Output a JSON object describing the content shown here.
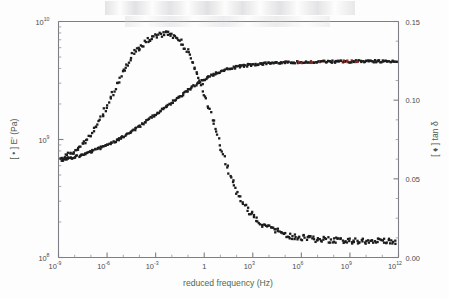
{
  "figure": {
    "title": "",
    "background_color": "#fdfdfd",
    "axis_color": "#7e7e84",
    "marker_color": "#1c1c1c",
    "accent_color": "#8a2a22"
  },
  "axes": {
    "x": {
      "label": "reduced frequency (Hz)",
      "scale": "log",
      "min_exp": -9,
      "max_exp": 12,
      "tick_labels": [
        "10-9",
        "10-6",
        "10-3",
        "1",
        "103",
        "106",
        "109",
        "1012"
      ],
      "tick_mantissas": [
        "10",
        "10",
        "10",
        "1",
        "10",
        "10",
        "10",
        "10"
      ],
      "tick_exponents": [
        "-9",
        "-6",
        "-3",
        "",
        "3",
        "6",
        "9",
        "12"
      ],
      "tick_exps_numeric": [
        -9,
        -6,
        -3,
        0,
        3,
        6,
        9,
        12
      ]
    },
    "y_left": {
      "label": "[ • ] E' (Pa)",
      "label_marker": "•",
      "label_text": "E' (Pa)",
      "scale": "log",
      "min_exp": 8,
      "max_exp": 10,
      "tick_mantissas": [
        "10",
        "10",
        "10"
      ],
      "tick_exponents": [
        "8",
        "9",
        "10"
      ],
      "tick_exps_numeric": [
        8,
        9,
        10
      ]
    },
    "y_right": {
      "label": "[ ♦ ] tan δ",
      "label_marker": "♦",
      "label_text": "tan δ",
      "scale": "linear",
      "min": 0.0,
      "max": 0.15,
      "tick_labels": [
        "0.00",
        "0.05",
        "0.10",
        "0.15"
      ],
      "tick_values": [
        0.0,
        0.05,
        0.1,
        0.15
      ],
      "minor_step": 0.0125
    }
  },
  "chart_data": {
    "type": "scatter",
    "title": "",
    "xlabel": "reduced frequency (Hz)",
    "ylabel": "[ • ] E' (Pa)",
    "ylabel_right": "[ ♦ ] tan δ",
    "xlim_log10": [
      -9,
      12
    ],
    "ylim_left_log10": [
      8,
      10
    ],
    "ylim_right": [
      0,
      0.15
    ],
    "grid": false,
    "legend": "none (markers identified in axis labels)",
    "series": [
      {
        "name": "E' (Pa)",
        "marker": "•",
        "axis": "left",
        "color": "#1c1c1c",
        "x_log10": [
          -8.82,
          -8.72,
          -8.62,
          -8.5,
          -8.38,
          -8.28,
          -8.16,
          -8.06,
          -7.95,
          -7.85,
          -7.72,
          -7.6,
          -7.5,
          -7.38,
          -7.26,
          -7.14,
          -7.02,
          -6.9,
          -6.78,
          -6.64,
          -6.5,
          -6.38,
          -6.24,
          -6.1,
          -5.96,
          -5.82,
          -5.68,
          -5.54,
          -5.4,
          -5.26,
          -5.1,
          -4.96,
          -4.8,
          -4.66,
          -4.5,
          -4.34,
          -4.18,
          -4.02,
          -3.86,
          -3.7,
          -3.54,
          -3.36,
          -3.2,
          -3.02,
          -2.86,
          -2.68,
          -2.5,
          -2.32,
          -2.14,
          -1.96,
          -1.78,
          -1.6,
          -1.42,
          -1.22,
          -1.04,
          -0.84,
          -0.66,
          -0.46,
          -0.26,
          -0.06,
          0.14,
          0.34,
          0.56,
          0.76,
          0.98,
          1.18,
          1.4,
          1.62,
          1.84,
          2.06,
          2.3,
          2.52,
          2.76,
          3.0,
          3.24,
          3.5,
          3.74,
          4.0,
          4.26,
          4.52,
          4.8,
          5.06,
          5.34,
          5.62,
          5.9,
          6.2,
          6.48,
          6.78,
          7.08,
          7.38,
          7.7,
          8.0,
          8.32,
          8.64,
          8.96,
          9.3,
          9.62,
          9.96,
          10.3,
          10.64,
          10.98,
          11.3,
          11.62,
          11.85
        ],
        "y_pa": [
          670000000.0,
          675000000.0,
          680000000.0,
          685000000.0,
          690000000.0,
          695000000.0,
          700000000.0,
          705000000.0,
          710000000.0,
          720000000.0,
          730000000.0,
          740000000.0,
          750000000.0,
          760000000.0,
          770000000.0,
          780000000.0,
          790000000.0,
          800000000.0,
          810000000.0,
          825000000.0,
          840000000.0,
          855000000.0,
          870000000.0,
          885000000.0,
          900000000.0,
          920000000.0,
          940000000.0,
          960000000.0,
          980000000.0,
          1000000000.0,
          1030000000.0,
          1060000000.0,
          1090000000.0,
          1120000000.0,
          1160000000.0,
          1200000000.0,
          1240000000.0,
          1280000000.0,
          1330000000.0,
          1380000000.0,
          1430000000.0,
          1490000000.0,
          1550000000.0,
          1610000000.0,
          1680000000.0,
          1750000000.0,
          1820000000.0,
          1900000000.0,
          1980000000.0,
          2070000000.0,
          2160000000.0,
          2260000000.0,
          2360000000.0,
          2470000000.0,
          2580000000.0,
          2700000000.0,
          2820000000.0,
          2950000000.0,
          3080000000.0,
          3200000000.0,
          3320000000.0,
          3440000000.0,
          3550000000.0,
          3660000000.0,
          3760000000.0,
          3850000000.0,
          3930000000.0,
          4000000000.0,
          4070000000.0,
          4130000000.0,
          4180000000.0,
          4230000000.0,
          4270000000.0,
          4310000000.0,
          4340000000.0,
          4370000000.0,
          4400000000.0,
          4420000000.0,
          4440000000.0,
          4460000000.0,
          4480000000.0,
          4490000000.0,
          4500000000.0,
          4510000000.0,
          4520000000.0,
          4530000000.0,
          4540000000.0,
          4550000000.0,
          4550000000.0,
          4560000000.0,
          4570000000.0,
          4570000000.0,
          4580000000.0,
          4580000000.0,
          4590000000.0,
          4590000000.0,
          4600000000.0,
          4600000000.0,
          4600000000.0,
          4610000000.0,
          4610000000.0,
          4610000000.0,
          4620000000.0,
          4620000000.0,
          4620000000.0
        ]
      },
      {
        "name": "tan delta",
        "marker": "♦",
        "axis": "right",
        "color": "#1c1c1c",
        "x_log10": [
          -8.86,
          -8.74,
          -8.62,
          -8.5,
          -8.4,
          -8.28,
          -8.18,
          -8.06,
          -7.96,
          -7.84,
          -7.74,
          -7.62,
          -7.5,
          -7.38,
          -7.26,
          -7.12,
          -7.0,
          -6.86,
          -6.72,
          -6.58,
          -6.44,
          -6.3,
          -6.16,
          -6.0,
          -5.86,
          -5.7,
          -5.54,
          -5.38,
          -5.22,
          -5.06,
          -4.9,
          -4.72,
          -4.56,
          -4.38,
          -4.22,
          -4.04,
          -3.86,
          -3.7,
          -3.52,
          -3.34,
          -3.16,
          -2.98,
          -2.8,
          -2.62,
          -2.44,
          -2.26,
          -2.08,
          -1.9,
          -1.72,
          -1.54,
          -1.36,
          -1.18,
          -1.0,
          -0.82,
          -0.64,
          -0.46,
          -0.28,
          -0.1,
          0.08,
          0.26,
          0.44,
          0.62,
          0.8,
          0.98,
          1.16,
          1.34,
          1.52,
          1.7,
          1.9,
          2.1,
          2.3,
          2.5,
          2.72,
          2.94,
          3.16,
          3.4,
          3.64,
          3.9,
          4.14,
          4.4,
          4.66,
          4.94,
          5.2,
          5.48,
          5.76,
          6.06,
          6.34,
          6.64,
          6.94,
          7.26,
          7.56,
          7.88,
          8.2,
          8.52,
          8.86,
          9.18,
          9.52,
          9.86,
          10.2,
          10.54,
          10.88,
          11.2,
          11.54,
          11.85
        ],
        "y_tan": [
          0.062,
          0.063,
          0.064,
          0.064,
          0.065,
          0.066,
          0.067,
          0.067,
          0.068,
          0.069,
          0.07,
          0.071,
          0.072,
          0.073,
          0.074,
          0.076,
          0.078,
          0.08,
          0.082,
          0.085,
          0.087,
          0.09,
          0.093,
          0.096,
          0.099,
          0.103,
          0.106,
          0.11,
          0.113,
          0.117,
          0.12,
          0.123,
          0.126,
          0.129,
          0.131,
          0.133,
          0.135,
          0.136,
          0.138,
          0.139,
          0.14,
          0.141,
          0.142,
          0.142,
          0.143,
          0.143,
          0.142,
          0.141,
          0.14,
          0.138,
          0.136,
          0.133,
          0.13,
          0.127,
          0.123,
          0.118,
          0.113,
          0.108,
          0.102,
          0.096,
          0.09,
          0.084,
          0.078,
          0.072,
          0.066,
          0.06,
          0.055,
          0.05,
          0.045,
          0.04,
          0.036,
          0.033,
          0.03,
          0.027,
          0.025,
          0.023,
          0.021,
          0.019,
          0.018,
          0.017,
          0.016,
          0.015,
          0.014,
          0.0135,
          0.013,
          0.0126,
          0.0122,
          0.0119,
          0.0116,
          0.0114,
          0.0112,
          0.011,
          0.0109,
          0.0108,
          0.0107,
          0.0106,
          0.0106,
          0.0105,
          0.0105,
          0.0105,
          0.0104,
          0.0104,
          0.0104,
          0.0104,
          0.0104
        ]
      }
    ],
    "annotations": [
      {
        "text": "E' rises from ~6.7e8 Pa at 1e-9 Hz to a ~4.6e9 Pa plateau above 1e6 Hz"
      },
      {
        "text": "tan delta peaks at ~0.143 near 1e-2 Hz and decays to ~0.010 at high frequency"
      }
    ]
  }
}
